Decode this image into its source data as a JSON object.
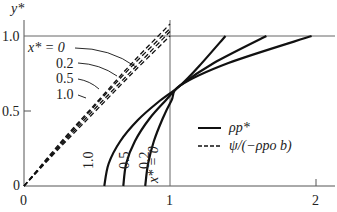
{
  "chart_data": {
    "type": "line",
    "title": "",
    "xlabel": "",
    "ylabel": "y*",
    "xlim": [
      0,
      2.2
    ],
    "ylim": [
      0,
      1.15
    ],
    "x_ticks": [
      "0",
      "1",
      "2"
    ],
    "y_ticks": [
      "0",
      "0.5",
      "1.0"
    ],
    "reference_lines": {
      "horizontal_y": 1.0,
      "vertical_x": 1.0
    },
    "legend": [
      {
        "style": "solid",
        "label": "ρp*"
      },
      {
        "style": "dashed",
        "label": "ψ/(−ρpo b)"
      }
    ],
    "series": [
      {
        "name": "ρp* (x* = 1.0)",
        "style": "solid",
        "x": [
          0.55,
          0.58,
          0.66,
          0.78,
          0.92,
          1.07,
          1.2,
          1.38
        ],
        "y": [
          0.0,
          0.15,
          0.3,
          0.44,
          0.56,
          0.67,
          0.8,
          1.0
        ]
      },
      {
        "name": "ρp* (x* = 0.5)",
        "style": "solid",
        "x": [
          0.68,
          0.7,
          0.76,
          0.86,
          0.97,
          1.07,
          1.3,
          1.66
        ],
        "y": [
          0.0,
          0.15,
          0.3,
          0.45,
          0.57,
          0.67,
          0.82,
          1.0
        ]
      },
      {
        "name": "ρp* (x* = 0.2)",
        "style": "solid",
        "x": [
          0.83,
          0.85,
          0.89,
          0.95,
          1.01,
          1.07,
          1.4,
          1.97
        ],
        "y": [
          0.0,
          0.15,
          0.3,
          0.45,
          0.57,
          0.67,
          0.82,
          1.0
        ]
      },
      {
        "name": "ψ/(−ρpo b) (x* = 0)",
        "style": "dashed",
        "x": [
          0,
          0.25,
          0.5,
          0.75,
          1.0
        ],
        "y": [
          0,
          0.29,
          0.56,
          0.83,
          1.08
        ]
      },
      {
        "name": "ψ/(−ρpo b) (x* = 0.2)",
        "style": "dashed",
        "x": [
          0,
          0.25,
          0.5,
          0.75,
          1.0
        ],
        "y": [
          0,
          0.28,
          0.55,
          0.81,
          1.05
        ]
      },
      {
        "name": "ψ/(−ρpo b) (x* = 0.5)",
        "style": "dashed",
        "x": [
          0,
          0.25,
          0.5,
          0.75,
          1.0
        ],
        "y": [
          0,
          0.27,
          0.53,
          0.78,
          1.03
        ]
      },
      {
        "name": "ψ/(−ρpo b) (x* = 1.0)",
        "style": "dashed",
        "x": [
          0,
          0.25,
          0.5,
          0.75,
          1.0
        ],
        "y": [
          0,
          0.26,
          0.51,
          0.76,
          1.0
        ]
      }
    ],
    "annotations": {
      "dashed_labels": [
        "x* = 0",
        "0.2",
        "0.5",
        "1.0"
      ],
      "solid_labels": [
        "1.0",
        "0.5",
        "0.2",
        "x* = 0"
      ]
    }
  },
  "labels": {
    "y_axis": "y*",
    "x0": "0",
    "x1": "1",
    "x2": "2",
    "y0": "0",
    "y05": "0.5",
    "y1": "1.0",
    "dash_x0": "x* = 0",
    "dash_02": "0.2",
    "dash_05": "0.5",
    "dash_10": "1.0",
    "solid_10": "1.0",
    "solid_05": "0.5",
    "solid_02": "0.2",
    "solid_x0": "x* = 0",
    "legend_solid": "ρp*",
    "legend_dashed": "ψ/(−ρpo b)"
  }
}
